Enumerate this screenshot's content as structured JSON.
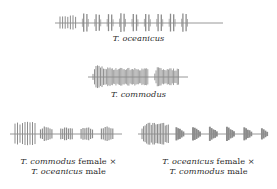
{
  "figure": {
    "type": "oscillogram-panel",
    "background_color": "#ffffff",
    "wave_color": "#8c8c8c",
    "wave_color_dark": "#7a7a7a",
    "text_color": "#2b2b2b"
  },
  "panels": [
    {
      "id": "oceanicus",
      "caption_lines": [
        [
          {
            "text": "T. oceanicus",
            "style": "italic"
          }
        ]
      ],
      "caption_plain": "T. oceanicus",
      "baseline_y": 21,
      "x_start": 60,
      "x_end": 218,
      "description": "Pure species song: leading trill of closely spaced pulses followed by evenly spaced pulse doublets"
    },
    {
      "id": "commodus",
      "caption_lines": [
        [
          {
            "text": "T. commodus",
            "style": "italic"
          }
        ]
      ],
      "caption_plain": "T. commodus",
      "baseline_y": 21,
      "x_start": 93,
      "x_end": 182,
      "description": "Pure species song: one long dense chirp with tall leading pulses, gap, then a shorter second chirp"
    },
    {
      "id": "hybrid-commodus-female-oceanicus-male",
      "caption_lines": [
        [
          {
            "text": "T. commodus",
            "style": "italic"
          },
          {
            "text": " female ×",
            "style": "roman"
          }
        ],
        [
          {
            "text": "T. oceanicus",
            "style": "italic"
          },
          {
            "text": " male",
            "style": "roman"
          }
        ]
      ],
      "caption_plain": "T. commodus female × T. oceanicus male",
      "baseline_y": 22,
      "x_start": 15,
      "x_end": 115,
      "description": "Hybrid song: leading trill of tall spiky pulses then four dense short chirp blocks"
    },
    {
      "id": "hybrid-oceanicus-female-commodus-male",
      "caption_lines": [
        [
          {
            "text": "T. oceanicus",
            "style": "italic"
          },
          {
            "text": " female ×",
            "style": "roman"
          }
        ],
        [
          {
            "text": "T. commodus",
            "style": "italic"
          },
          {
            "text": " male",
            "style": "roman"
          }
        ]
      ],
      "caption_plain": "T. oceanicus female × T. commodus male",
      "baseline_y": 22,
      "x_start": 4,
      "x_end": 124,
      "description": "Hybrid song: dense leading burst followed by seven wedge-shaped decaying chirps"
    }
  ],
  "chart_data": {
    "type": "line",
    "title": "",
    "xlabel": "",
    "ylabel": "",
    "series": [
      {
        "name": "T. oceanicus",
        "kind": "oscillogram",
        "baseline": 0,
        "pulse_groups": [
          {
            "type": "trill",
            "pulses": 7,
            "amplitude": 0.8
          },
          {
            "type": "doublet",
            "pulses": 2,
            "amplitude": 0.95
          },
          {
            "type": "doublet",
            "pulses": 2,
            "amplitude": 0.95
          },
          {
            "type": "doublet",
            "pulses": 2,
            "amplitude": 0.95
          },
          {
            "type": "doublet",
            "pulses": 2,
            "amplitude": 0.95
          },
          {
            "type": "doublet",
            "pulses": 2,
            "amplitude": 0.95
          },
          {
            "type": "doublet",
            "pulses": 2,
            "amplitude": 0.95
          },
          {
            "type": "doublet",
            "pulses": 2,
            "amplitude": 0.95
          },
          {
            "type": "doublet",
            "pulses": 2,
            "amplitude": 0.95
          },
          {
            "type": "doublet",
            "pulses": 2,
            "amplitude": 0.95
          }
        ]
      },
      {
        "name": "T. commodus",
        "kind": "oscillogram",
        "baseline": 0,
        "pulse_groups": [
          {
            "type": "chirp",
            "pulses": 40,
            "amplitude": 1.0,
            "length": 0.62
          },
          {
            "type": "gap",
            "pulses": 0,
            "amplitude": 0.0,
            "length": 0.07
          },
          {
            "type": "chirp",
            "pulses": 16,
            "amplitude": 0.75,
            "length": 0.27
          }
        ]
      },
      {
        "name": "T. commodus female × T. oceanicus male",
        "kind": "oscillogram",
        "baseline": 0,
        "pulse_groups": [
          {
            "type": "trill",
            "pulses": 9,
            "amplitude": 1.0
          },
          {
            "type": "chirp",
            "pulses": 7,
            "amplitude": 0.8
          },
          {
            "type": "chirp",
            "pulses": 7,
            "amplitude": 0.8
          },
          {
            "type": "chirp",
            "pulses": 7,
            "amplitude": 0.8
          },
          {
            "type": "chirp",
            "pulses": 7,
            "amplitude": 0.8
          }
        ]
      },
      {
        "name": "T. oceanicus female × T. commodus male",
        "kind": "oscillogram",
        "baseline": 0,
        "pulse_groups": [
          {
            "type": "burst",
            "pulses": 18,
            "amplitude": 1.0
          },
          {
            "type": "wedge",
            "pulses": 5,
            "amplitude": 0.75
          },
          {
            "type": "wedge",
            "pulses": 5,
            "amplitude": 0.75
          },
          {
            "type": "wedge",
            "pulses": 5,
            "amplitude": 0.75
          },
          {
            "type": "wedge",
            "pulses": 5,
            "amplitude": 0.75
          },
          {
            "type": "wedge",
            "pulses": 5,
            "amplitude": 0.7
          },
          {
            "type": "wedge",
            "pulses": 4,
            "amplitude": 0.65
          },
          {
            "type": "wedge",
            "pulses": 4,
            "amplitude": 0.6
          }
        ]
      }
    ]
  }
}
